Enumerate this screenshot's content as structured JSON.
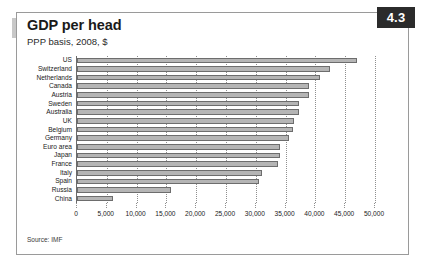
{
  "badge": {
    "number": "4.3"
  },
  "header": {
    "title": "GDP per head",
    "subtitle": "PPP basis, 2008, $"
  },
  "footer": {
    "source": "Source: IMF"
  },
  "chart_data": {
    "type": "bar",
    "orientation": "horizontal",
    "title": "GDP per head",
    "subtitle": "PPP basis, 2008, $",
    "xlabel": "",
    "ylabel": "",
    "xlim": [
      0,
      50000
    ],
    "grid": true,
    "legend": false,
    "source": "Source: IMF",
    "xticks": [
      0,
      5000,
      10000,
      15000,
      20000,
      25000,
      30000,
      35000,
      40000,
      45000,
      50000
    ],
    "xticklabels": [
      "0",
      "5,000",
      "10,000",
      "15,000",
      "20,000",
      "25,000",
      "30,000",
      "35,000",
      "40,000",
      "45,000",
      "50,000"
    ],
    "categories": [
      "US",
      "Switzerland",
      "Netherlands",
      "Canada",
      "Austria",
      "Sweden",
      "Australia",
      "UK",
      "Belgium",
      "Germany",
      "Euro area",
      "Japan",
      "France",
      "Italy",
      "Spain",
      "Russia",
      "China"
    ],
    "values": [
      47000,
      42500,
      40700,
      39000,
      39000,
      37300,
      37200,
      36400,
      36200,
      35600,
      34000,
      34000,
      33700,
      31000,
      30600,
      15800,
      6000
    ],
    "bar_color": "#b5b5b5",
    "bar_edge_color": "#6d6d6d"
  }
}
